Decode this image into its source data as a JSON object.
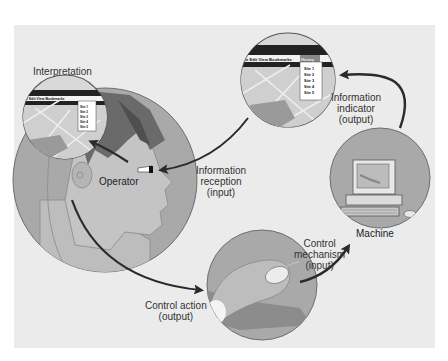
{
  "diagram": {
    "nodes": {
      "operator": {
        "label": "Operator"
      },
      "machine": {
        "label": "Machine"
      },
      "interpretation_view": {
        "label": "Interpretation"
      },
      "indicator_view": {
        "label": "Browser display"
      },
      "control_view": {
        "label": "Hand on mouse"
      }
    },
    "labels": {
      "interpretation": "Interpretation",
      "info_reception": [
        "Information",
        "reception",
        "(input)"
      ],
      "info_indicator": [
        "Information",
        "indicator",
        "(output)"
      ],
      "control_mechanism": [
        "Control",
        "mechanism",
        "(input)"
      ],
      "control_action": [
        "Control action",
        "(output)"
      ]
    },
    "browser_menu": {
      "items": [
        "File",
        "Edit",
        "View",
        "Bookmarks",
        "History"
      ],
      "dropdown": [
        "Site 1",
        "Site 2",
        "Site 3",
        "Site 4",
        "Site 5"
      ]
    },
    "edges": [
      {
        "from": "machine",
        "to": "indicator_view",
        "label": "Information indicator (output)"
      },
      {
        "from": "indicator_view",
        "to": "operator",
        "label": "Information reception (input)"
      },
      {
        "from": "operator",
        "to": "interpretation_view",
        "label": "Interpretation"
      },
      {
        "from": "operator",
        "to": "control_view",
        "label": "Control action (output)"
      },
      {
        "from": "control_view",
        "to": "machine",
        "label": "Control mechanism (input)"
      }
    ],
    "colors": {
      "background": "#ebebeb",
      "circle_fill": "#a8a8a8",
      "arrow": "#2a2a2a",
      "text": "#333333"
    }
  }
}
